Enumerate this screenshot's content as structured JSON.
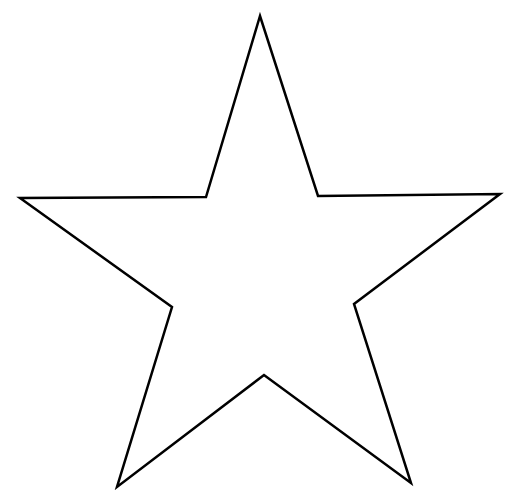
{
  "canvas": {
    "width": 519,
    "height": 498,
    "background": "#ffffff"
  },
  "shape": {
    "type": "star-outline",
    "points_count": 5,
    "stroke_color": "#000000",
    "fill_color": "#ffffff",
    "stroke_width": 2.5,
    "vertices": [
      [
        260,
        16
      ],
      [
        318,
        196
      ],
      [
        500,
        194
      ],
      [
        354,
        304
      ],
      [
        411,
        483
      ],
      [
        264,
        375
      ],
      [
        117,
        487
      ],
      [
        172,
        307
      ],
      [
        20,
        198
      ],
      [
        206,
        197
      ]
    ]
  }
}
